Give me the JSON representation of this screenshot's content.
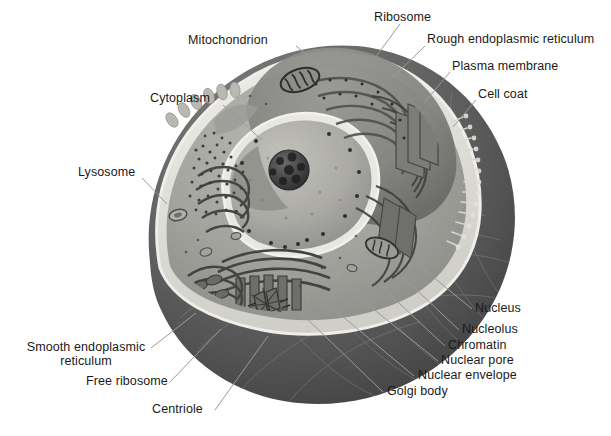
{
  "figure": {
    "background_color": "#ffffff",
    "label_color": "#1a1a1a",
    "leader_line_color": "#9a9a9a",
    "width": 611,
    "height": 436
  },
  "palette": {
    "cytoplasm": "#a9a9a6",
    "cytoplasm_light": "#bdbcb7",
    "cytoplasm_mid": "#9c9c98",
    "membrane_rim": "#e6e5e0",
    "outer_shell_dark": "#5d5d5d",
    "outer_shell_darker": "#4a4a4a",
    "outer_shell_mid": "#6e6e6e",
    "nucleus_fill": "#b4b3ae",
    "nucleolus": "#3b3b3b",
    "organelle_dark": "#4f4f4f",
    "organelle_mid": "#7c7c79",
    "rer_fill": "#8d8d89",
    "highlight": "#d8d7d2"
  },
  "labels": [
    {
      "id": "mitochondrion",
      "text": "Mitochondrion",
      "x": 188,
      "y": 34,
      "align": "left"
    },
    {
      "id": "ribosome",
      "text": "Ribosome",
      "x": 374,
      "y": 11,
      "align": "left"
    },
    {
      "id": "rough-er",
      "text": "Rough endoplasmic reticulum",
      "x": 427,
      "y": 33,
      "align": "left"
    },
    {
      "id": "plasma-membrane",
      "text": "Plasma membrane",
      "x": 452,
      "y": 60,
      "align": "left"
    },
    {
      "id": "cell-coat",
      "text": "Cell coat",
      "x": 478,
      "y": 88,
      "align": "left"
    },
    {
      "id": "cytoplasm",
      "text": "Cytoplasm",
      "x": 150,
      "y": 92,
      "align": "left"
    },
    {
      "id": "lysosome",
      "text": "Lysosome",
      "x": 78,
      "y": 166,
      "align": "left"
    },
    {
      "id": "nucleus",
      "text": "Nucleus",
      "x": 475,
      "y": 302,
      "align": "left"
    },
    {
      "id": "nucleolus",
      "text": "Nucleolus",
      "x": 462,
      "y": 323,
      "align": "left"
    },
    {
      "id": "chromatin",
      "text": "Chromatin",
      "x": 448,
      "y": 339,
      "align": "left"
    },
    {
      "id": "nuclear-pore",
      "text": "Nuclear pore",
      "x": 441,
      "y": 354,
      "align": "left"
    },
    {
      "id": "nuclear-envelope",
      "text": "Nuclear envelope",
      "x": 418,
      "y": 369,
      "align": "left"
    },
    {
      "id": "golgi-body",
      "text": "Golgi body",
      "x": 387,
      "y": 385,
      "align": "left"
    },
    {
      "id": "smooth-er",
      "text": "Smooth endoplasmic reticulum",
      "x": 22,
      "y": 341,
      "align": "center",
      "multiline": true
    },
    {
      "id": "free-ribosome",
      "text": "Free ribosome",
      "x": 86,
      "y": 375,
      "align": "left"
    },
    {
      "id": "centriole",
      "text": "Centriole",
      "x": 152,
      "y": 403,
      "align": "left"
    }
  ],
  "leader_lines": [
    {
      "id": "leader-mitochondrion",
      "from": [
        296,
        46
      ],
      "to": [
        330,
        73
      ]
    },
    {
      "id": "leader-ribosome",
      "from": [
        400,
        24
      ],
      "to": [
        372,
        62
      ]
    },
    {
      "id": "leader-rough-er",
      "from": [
        425,
        46
      ],
      "to": [
        390,
        80
      ]
    },
    {
      "id": "leader-plasma-membrane",
      "from": [
        450,
        72
      ],
      "to": [
        424,
        103
      ]
    },
    {
      "id": "leader-cell-coat",
      "from": [
        476,
        100
      ],
      "to": [
        453,
        127
      ]
    },
    {
      "id": "leader-cytoplasm",
      "from": [
        223,
        105
      ],
      "to": [
        262,
        140
      ]
    },
    {
      "id": "leader-lysosome",
      "from": [
        142,
        178
      ],
      "to": [
        167,
        204
      ]
    },
    {
      "id": "leader-nucleus",
      "from": [
        472,
        309
      ],
      "to": [
        415,
        262
      ]
    },
    {
      "id": "leader-nucleolus",
      "from": [
        459,
        330
      ],
      "to": [
        404,
        278
      ]
    },
    {
      "id": "leader-chromatin",
      "from": [
        445,
        346
      ],
      "to": [
        386,
        291
      ]
    },
    {
      "id": "leader-nuclear-pore",
      "from": [
        438,
        361
      ],
      "to": [
        362,
        300
      ]
    },
    {
      "id": "leader-nuclear-envelope",
      "from": [
        414,
        376
      ],
      "to": [
        330,
        306
      ]
    },
    {
      "id": "leader-golgi-body",
      "from": [
        383,
        392
      ],
      "to": [
        300,
        312
      ]
    },
    {
      "id": "leader-smooth-er",
      "from": [
        151,
        348
      ],
      "to": [
        196,
        313
      ]
    },
    {
      "id": "leader-free-ribosome",
      "from": [
        170,
        382
      ],
      "to": [
        221,
        329
      ]
    },
    {
      "id": "leader-centriole",
      "from": [
        215,
        410
      ],
      "to": [
        268,
        336
      ]
    }
  ],
  "structures": [
    {
      "id": "plasma-membrane",
      "name": "Plasma membrane"
    },
    {
      "id": "cell-coat",
      "name": "Cell coat"
    },
    {
      "id": "cytoplasm",
      "name": "Cytoplasm"
    },
    {
      "id": "nucleus",
      "name": "Nucleus"
    },
    {
      "id": "nucleolus",
      "name": "Nucleolus"
    },
    {
      "id": "chromatin",
      "name": "Chromatin"
    },
    {
      "id": "nuclear-pore",
      "name": "Nuclear pore"
    },
    {
      "id": "nuclear-envelope",
      "name": "Nuclear envelope"
    },
    {
      "id": "rough-er",
      "name": "Rough endoplasmic reticulum"
    },
    {
      "id": "smooth-er",
      "name": "Smooth endoplasmic reticulum"
    },
    {
      "id": "golgi-body",
      "name": "Golgi body"
    },
    {
      "id": "mitochondrion",
      "name": "Mitochondrion"
    },
    {
      "id": "lysosome",
      "name": "Lysosome"
    },
    {
      "id": "ribosome",
      "name": "Ribosome"
    },
    {
      "id": "free-ribosome",
      "name": "Free ribosome"
    },
    {
      "id": "centriole",
      "name": "Centriole"
    }
  ]
}
